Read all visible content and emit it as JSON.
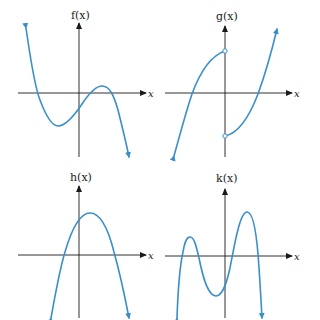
{
  "colors": {
    "curve": "#3a8fc9",
    "axis": "#1a1a1a"
  },
  "graphs": [
    {
      "id": "f",
      "ylabel": "f(x)",
      "xlabel": "x",
      "shape": "cubic-negative-leading",
      "features": [
        "falls from upper left",
        "local minimum below x-axis",
        "local maximum above x-axis",
        "falls to lower right"
      ],
      "discontinuities": []
    },
    {
      "id": "g",
      "ylabel": "g(x)",
      "xlabel": "x",
      "shape": "piecewise-increasing",
      "features": [
        "rises from lower left",
        "jump discontinuity at x=0",
        "rises to upper right"
      ],
      "discontinuities": [
        {
          "x": 0,
          "open_top": true,
          "open_bottom": true
        }
      ]
    },
    {
      "id": "h",
      "ylabel": "h(x)",
      "xlabel": "x",
      "shape": "downward-parabola",
      "features": [
        "single maximum slightly right of y-axis",
        "two x-intercepts"
      ],
      "discontinuities": []
    },
    {
      "id": "k",
      "ylabel": "k(x)",
      "xlabel": "x",
      "shape": "quartic-negative-leading",
      "features": [
        "two local maxima",
        "one local minimum below x-axis",
        "four x-intercepts"
      ],
      "discontinuities": []
    }
  ]
}
